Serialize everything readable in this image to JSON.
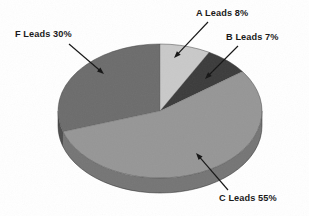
{
  "figure": {
    "background_color": "#ffffff",
    "text_color": "#1a1a1a"
  },
  "labels": {
    "a": "A Leads 8%",
    "b": "B Leads 7%",
    "c": "C Leads 55%",
    "f": "F Leads 30%"
  },
  "chart_data": {
    "type": "pie",
    "title": "",
    "subtitle": "",
    "xlabel": "",
    "ylabel": "",
    "style": "3d-exploded-disc",
    "start_angle_deg": 0,
    "direction": "clockwise",
    "legend_position": "none",
    "labels_position": "outside-with-leader-arrows",
    "grid": false,
    "categories": [
      "A Leads",
      "B Leads",
      "C Leads",
      "F Leads"
    ],
    "values": [
      8,
      7,
      55,
      30
    ],
    "value_unit": "%",
    "total": 100,
    "slices": [
      {
        "name": "A Leads",
        "value": 8,
        "label": "A Leads 8%",
        "color": "#c9c9c9",
        "side_color": "#a8a8a8",
        "start_deg": 0,
        "end_deg": 28.8
      },
      {
        "name": "B Leads",
        "value": 7,
        "label": "B Leads 7%",
        "color": "#3b3b3b",
        "side_color": "#2a2a2a",
        "start_deg": 28.8,
        "end_deg": 54.0
      },
      {
        "name": "C Leads",
        "value": 55,
        "label": "C Leads 55%",
        "color": "#969696",
        "side_color": "#757575",
        "start_deg": 54.0,
        "end_deg": 252.0
      },
      {
        "name": "F Leads",
        "value": 30,
        "label": "F Leads 30%",
        "color": "#6c6c6c",
        "side_color": "#4e4e4e",
        "start_deg": 252.0,
        "end_deg": 360.0
      }
    ],
    "geometry": {
      "center_x": 160,
      "center_y": 111,
      "radius_x": 102,
      "radius_y": 67,
      "depth": 15
    },
    "annotations": [
      {
        "text": "A Leads 8%",
        "arrow_from": [
          208,
          22
        ],
        "arrow_to": [
          174,
          58
        ]
      },
      {
        "text": "B Leads 7%",
        "arrow_from": [
          238,
          46
        ],
        "arrow_to": [
          205,
          79
        ]
      },
      {
        "text": "F Leads 30%",
        "arrow_from": [
          69,
          44
        ],
        "arrow_to": [
          104,
          74
        ]
      },
      {
        "text": "C Leads 55%",
        "arrow_from": [
          228,
          190
        ],
        "arrow_to": [
          196,
          153
        ]
      }
    ]
  }
}
